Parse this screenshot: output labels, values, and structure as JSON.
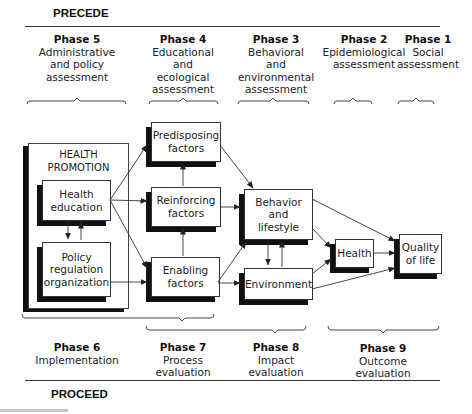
{
  "diagram": {
    "top_section": "PRECEDE",
    "bottom_section": "PROCEED",
    "top_phases": [
      {
        "title": "Phase 5",
        "desc": "Administrative\nand policy\nassessment"
      },
      {
        "title": "Phase 4",
        "desc": "Educational\nand\necological\nassessment"
      },
      {
        "title": "Phase 3",
        "desc": "Behavioral\nand\nenvironmental\nassessment"
      },
      {
        "title": "Phase 2",
        "desc": "Epidemiological\nassessment"
      },
      {
        "title": "Phase 1",
        "desc": "Social\nassessment"
      }
    ],
    "bottom_phases": [
      {
        "title": "Phase 6",
        "desc": "Implementation"
      },
      {
        "title": "Phase 7",
        "desc": "Process\nevaluation"
      },
      {
        "title": "Phase 8",
        "desc": "Impact\nevaluation"
      },
      {
        "title": "Phase 9",
        "desc": "Outcome\nevaluation"
      }
    ],
    "container": {
      "label": "HEALTH\nPROMOTION"
    },
    "nodes": {
      "health_education": "Health\neducation",
      "policy": "Policy\nregulation\norganization",
      "predisposing": "Predisposing\nfactors",
      "reinforcing": "Reinforcing\nfactors",
      "enabling": "Enabling\nfactors",
      "behavior": "Behavior\nand\nlifestyle",
      "environment": "Environment",
      "health": "Health",
      "quality": "Quality\nof life"
    },
    "edges": [
      [
        "health_education",
        "predisposing"
      ],
      [
        "health_education",
        "reinforcing"
      ],
      [
        "health_education",
        "enabling"
      ],
      [
        "health_education",
        "policy"
      ],
      [
        "policy",
        "health_education"
      ],
      [
        "policy",
        "enabling"
      ],
      [
        "reinforcing",
        "predisposing"
      ],
      [
        "enabling",
        "reinforcing"
      ],
      [
        "predisposing",
        "behavior"
      ],
      [
        "reinforcing",
        "behavior"
      ],
      [
        "enabling",
        "behavior"
      ],
      [
        "enabling",
        "environment"
      ],
      [
        "behavior",
        "environment"
      ],
      [
        "environment",
        "behavior"
      ],
      [
        "behavior",
        "health"
      ],
      [
        "environment",
        "health"
      ],
      [
        "behavior",
        "quality"
      ],
      [
        "health",
        "quality"
      ],
      [
        "environment",
        "quality"
      ]
    ]
  }
}
